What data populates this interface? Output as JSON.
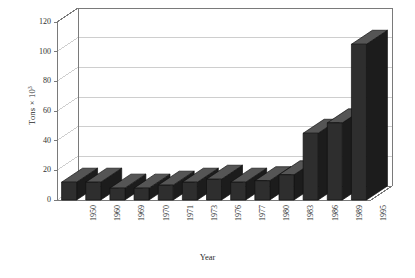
{
  "chart_data": {
    "type": "bar",
    "title": "",
    "subtitle": "",
    "xlabel": "Year",
    "ylabel": "Tons × 10",
    "ylabel_exponent": "3",
    "categories": [
      "1950",
      "1960",
      "1969",
      "1970",
      "1971",
      "1973",
      "1976",
      "1977",
      "1980",
      "1983",
      "1986",
      "1989",
      "1995"
    ],
    "values": [
      12,
      12,
      8,
      8,
      10,
      12,
      14,
      12,
      13,
      17,
      45,
      52,
      105
    ],
    "ylim": [
      0,
      120
    ],
    "yticks": [
      0,
      20,
      40,
      60,
      80,
      100,
      120
    ],
    "ytick_labels": [
      "0",
      "20",
      "40",
      "60",
      "80",
      "100",
      "120"
    ],
    "grid": true,
    "grid_axis": "y",
    "legend": "none",
    "projection": "3d",
    "bar_color": "#2e2e2e",
    "bar_top_color": "#555555",
    "bar_side_color": "#1c1c1c",
    "axis_color": "#7a7a7a",
    "grid_color": "#b9b9b9",
    "background": "#ffffff"
  }
}
